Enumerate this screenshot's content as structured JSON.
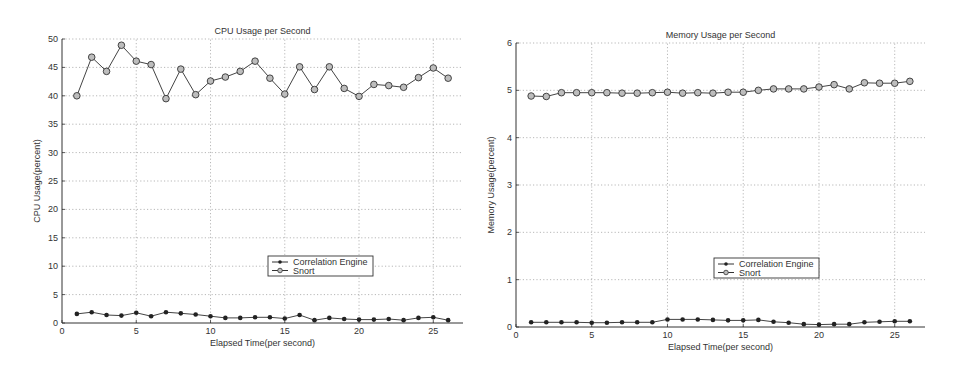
{
  "chart_data": [
    {
      "type": "line",
      "title": "CPU Usage per Second",
      "xlabel": "Elapsed Time(per second)",
      "ylabel": "CPU Usage(percent)",
      "xlim": [
        0,
        27
      ],
      "ylim": [
        0,
        50
      ],
      "xticks": [
        0,
        5,
        10,
        15,
        20,
        25
      ],
      "yticks": [
        0,
        5,
        10,
        15,
        20,
        25,
        30,
        35,
        40,
        45,
        50
      ],
      "grid": true,
      "legend_position": "center-right",
      "x": [
        1,
        2,
        3,
        4,
        5,
        6,
        7,
        8,
        9,
        10,
        11,
        12,
        13,
        14,
        15,
        16,
        17,
        18,
        19,
        20,
        21,
        22,
        23,
        24,
        25,
        26
      ],
      "series": [
        {
          "name": "Correlation Engine",
          "marker": "filled-dot",
          "values": [
            1.6,
            1.9,
            1.4,
            1.3,
            1.8,
            1.2,
            1.9,
            1.7,
            1.5,
            1.2,
            0.9,
            0.9,
            1.0,
            1.0,
            0.8,
            1.4,
            0.5,
            0.9,
            0.7,
            0.6,
            0.6,
            0.7,
            0.5,
            0.9,
            1.0,
            0.5
          ]
        },
        {
          "name": "Snort",
          "marker": "open-circle",
          "values": [
            40,
            46.8,
            44.3,
            48.9,
            46.1,
            45.5,
            39.5,
            44.7,
            40.2,
            42.6,
            43.3,
            44.3,
            46.1,
            43.1,
            40.3,
            45.1,
            41.1,
            45.1,
            41.3,
            39.9,
            42.0,
            41.8,
            41.5,
            43.2,
            44.9,
            43.1
          ]
        }
      ]
    },
    {
      "type": "line",
      "title": "Memory Usage per Second",
      "xlabel": "Elapsed Time(per second)",
      "ylabel": "Memory Usage(percent)",
      "xlim": [
        0,
        27
      ],
      "ylim": [
        0,
        6
      ],
      "xticks": [
        0,
        5,
        10,
        15,
        20,
        25
      ],
      "yticks": [
        0,
        1,
        2,
        3,
        4,
        5,
        6
      ],
      "grid": true,
      "legend_position": "center-right",
      "x": [
        1,
        2,
        3,
        4,
        5,
        6,
        7,
        8,
        9,
        10,
        11,
        12,
        13,
        14,
        15,
        16,
        17,
        18,
        19,
        20,
        21,
        22,
        23,
        24,
        25,
        26
      ],
      "series": [
        {
          "name": "Correlation Engine",
          "marker": "filled-dot",
          "values": [
            0.1,
            0.1,
            0.1,
            0.1,
            0.09,
            0.09,
            0.1,
            0.1,
            0.1,
            0.16,
            0.16,
            0.16,
            0.15,
            0.14,
            0.14,
            0.15,
            0.11,
            0.09,
            0.06,
            0.05,
            0.06,
            0.06,
            0.1,
            0.11,
            0.12,
            0.12
          ]
        },
        {
          "name": "Snort",
          "marker": "open-circle",
          "values": [
            4.88,
            4.87,
            4.95,
            4.95,
            4.95,
            4.95,
            4.94,
            4.94,
            4.95,
            4.96,
            4.94,
            4.95,
            4.94,
            4.96,
            4.96,
            5.0,
            5.03,
            5.03,
            5.03,
            5.07,
            5.12,
            5.03,
            5.16,
            5.15,
            5.15,
            5.19
          ]
        }
      ]
    }
  ],
  "layout": [
    {
      "left": 0,
      "width": 478,
      "x0": 62,
      "x1": 463,
      "y0": 323,
      "y1": 39,
      "legend": {
        "x": 268,
        "y": 256,
        "w": 105,
        "h": 20
      }
    },
    {
      "left": 478,
      "width": 479,
      "x0": 38,
      "x1": 447,
      "y0": 327,
      "y1": 43,
      "legend": {
        "x": 236,
        "y": 258,
        "w": 105,
        "h": 20
      }
    }
  ]
}
